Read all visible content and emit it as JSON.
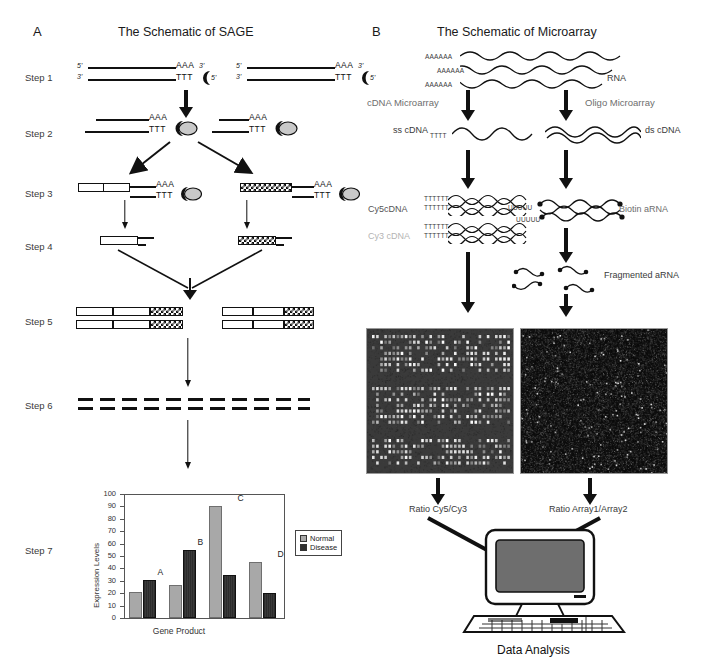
{
  "panelA": {
    "letter": "A",
    "title": "The Schematic of SAGE",
    "steps": [
      {
        "id": "step1",
        "label": "Step 1"
      },
      {
        "id": "step2",
        "label": "Step 2"
      },
      {
        "id": "step3",
        "label": "Step 3"
      },
      {
        "id": "step4",
        "label": "Step 4"
      },
      {
        "id": "step5",
        "label": "Step 5"
      },
      {
        "id": "step6",
        "label": "Step 6"
      },
      {
        "id": "step7",
        "label": "Step 7"
      }
    ],
    "sequence_labels": {
      "five_prime": "5'",
      "three_prime": "3'",
      "polyA": "AAA",
      "polyT": "TTT"
    },
    "chart_data": {
      "type": "bar",
      "title": "",
      "xlabel": "Gene Product",
      "ylabel": "Expression Levels",
      "ylim": [
        0,
        100
      ],
      "ytick_step": 10,
      "yticks": [
        0,
        10,
        20,
        30,
        40,
        50,
        60,
        70,
        80,
        90,
        100
      ],
      "categories": [
        "A",
        "B",
        "C",
        "D"
      ],
      "grid": false,
      "legend_position": "right",
      "series": [
        {
          "name": "Normal",
          "color": "#a8a8a8",
          "values": [
            21,
            27,
            90,
            45
          ]
        },
        {
          "name": "Disease",
          "color": "#2f2f2f",
          "values": [
            31,
            55,
            35,
            20
          ]
        }
      ]
    }
  },
  "panelB": {
    "letter": "B",
    "title": "The Schematic of Microarray",
    "labels": {
      "rna": "RNA",
      "polyA": "AAAAAA",
      "cdna_microarray": "cDNA Microarray",
      "oligo_microarray": "Oligo Microarray",
      "ss_cdna": "ss cDNA",
      "ds_cdna": "ds cDNA",
      "tttt_short": "TTTT",
      "tttt_long": "TTTTTT",
      "uuuuu": "UUUUU",
      "cy5_cdna": "Cy5cDNA",
      "cy3_cdna": "Cy3 cDNA",
      "biotin_arna": "Biotin aRNA",
      "fragmented_arna": "Fragmented aRNA",
      "ratio_left": "Ratio Cy5/Cy3",
      "ratio_right": "Ratio Array1/Array2",
      "data_analysis": "Data Analysis"
    },
    "colors": {
      "cy5": "#555555",
      "cy3": "#b4b4b4",
      "label_gray": "#7d7d7d",
      "array_left_bg": "#3a3a3a",
      "array_right_bg": "#0d0d0d"
    }
  }
}
